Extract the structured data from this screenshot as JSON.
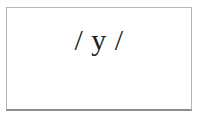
{
  "figure": {
    "label": "phoneme-notation-card",
    "background_color": "#ffffff",
    "border_color": "#b4b4b4",
    "border_bottom_color": "#8e8e8e"
  },
  "notation": {
    "text": "/ y /",
    "slash_open": "/",
    "symbol": "y",
    "slash_close": "/",
    "color": "#231f20"
  }
}
